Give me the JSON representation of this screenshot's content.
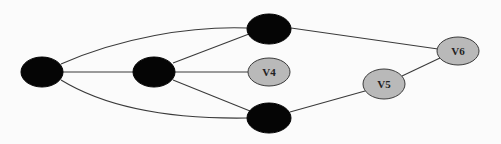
{
  "diagram": {
    "type": "undirected-graph",
    "colors": {
      "background": "#fbfbfb",
      "edge": "#3a3a3a",
      "black_node_fill": "#050505",
      "gray_node_fill": "#b9b9b9",
      "label": "#222222"
    },
    "nodes": [
      {
        "id": "n1",
        "label": "",
        "style": "black",
        "cx": 42,
        "cy": 72,
        "rx": 21,
        "ry": 15
      },
      {
        "id": "n2",
        "label": "",
        "style": "black",
        "cx": 154,
        "cy": 72,
        "rx": 21,
        "ry": 15
      },
      {
        "id": "n3",
        "label": "",
        "style": "black",
        "cx": 269,
        "cy": 29,
        "rx": 22,
        "ry": 15
      },
      {
        "id": "v4",
        "label": "V4",
        "style": "gray",
        "cx": 269,
        "cy": 72,
        "rx": 21,
        "ry": 14
      },
      {
        "id": "n5",
        "label": "",
        "style": "black",
        "cx": 269,
        "cy": 118,
        "rx": 22,
        "ry": 15
      },
      {
        "id": "v5",
        "label": "V5",
        "style": "gray",
        "cx": 384,
        "cy": 84,
        "rx": 21,
        "ry": 15
      },
      {
        "id": "v6",
        "label": "V6",
        "style": "gray",
        "cx": 458,
        "cy": 51,
        "rx": 21,
        "ry": 14
      }
    ],
    "edges": [
      {
        "from": "n1",
        "to": "n3",
        "shape": "curve"
      },
      {
        "from": "n1",
        "to": "n2",
        "shape": "line"
      },
      {
        "from": "n1",
        "to": "n5",
        "shape": "curve"
      },
      {
        "from": "n2",
        "to": "n3",
        "shape": "line"
      },
      {
        "from": "n2",
        "to": "v4",
        "shape": "line"
      },
      {
        "from": "n2",
        "to": "n5",
        "shape": "line"
      },
      {
        "from": "n3",
        "to": "v6",
        "shape": "line"
      },
      {
        "from": "n5",
        "to": "v5",
        "shape": "line"
      },
      {
        "from": "v5",
        "to": "v6",
        "shape": "line"
      }
    ]
  }
}
